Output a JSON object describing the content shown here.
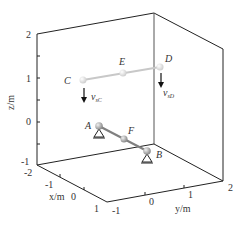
{
  "axes": {
    "z": {
      "label": "z/m",
      "ticks": [
        "2",
        "1",
        "0",
        "-1"
      ]
    },
    "x": {
      "label": "x/m",
      "ticks": [
        "-2",
        "-1",
        "0",
        "1"
      ]
    },
    "y": {
      "label": "y/m",
      "ticks": [
        "-1",
        "0",
        "1",
        "2"
      ]
    }
  },
  "points": {
    "A": "A",
    "B": "B",
    "C": "C",
    "D": "D",
    "E": "E",
    "F": "F"
  },
  "velocities": {
    "vC": {
      "main": "v",
      "sub": "sC"
    },
    "vD": {
      "main": "v",
      "sub": "sD"
    }
  },
  "colors": {
    "frame": "#222222",
    "faded_bar": "#c8c8c8",
    "bar": "#808080",
    "ball": "#a8a8a8"
  }
}
